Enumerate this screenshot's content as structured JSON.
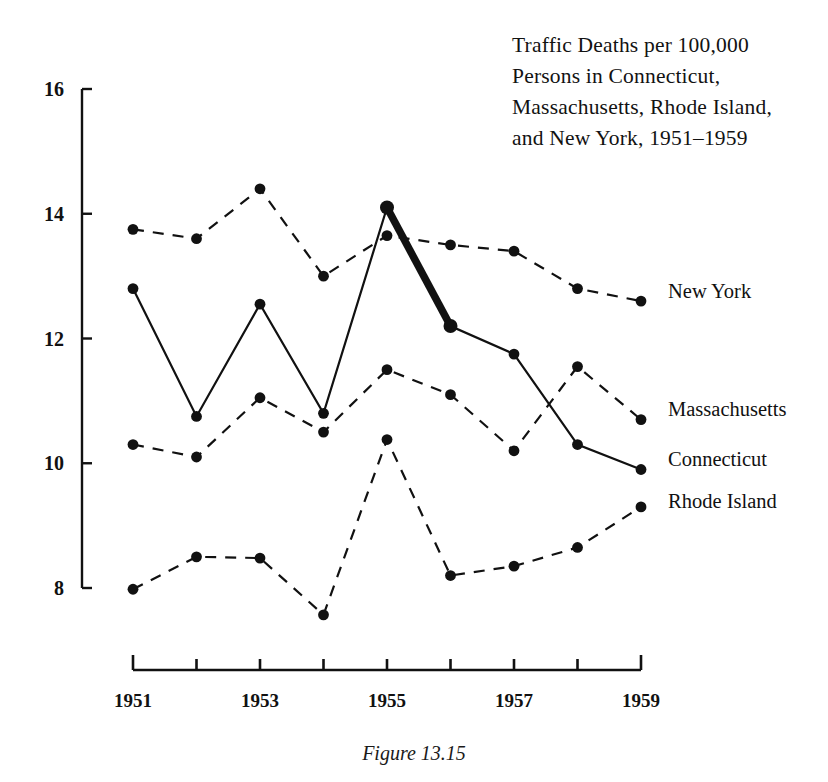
{
  "figure": {
    "caption": "Figure 13.15",
    "title_lines": [
      "Traffic Deaths per 100,000",
      "Persons in Connecticut,",
      "Massachusetts, Rhode Island,",
      "and New York, 1951–1959"
    ]
  },
  "axes": {
    "y_ticks": [
      "16",
      "14",
      "12",
      "10",
      "8"
    ],
    "x_ticks": [
      "1951",
      "",
      "1953",
      "",
      "1955",
      "",
      "1957",
      "",
      "1959"
    ],
    "x_tick_labels_visible": [
      "1951",
      "1953",
      "1955",
      "1957",
      "1959"
    ]
  },
  "series_labels": [
    {
      "name": "New York",
      "label": "New York"
    },
    {
      "name": "Massachusetts",
      "label": "Massachusetts"
    },
    {
      "name": "Connecticut",
      "label": "Connecticut"
    },
    {
      "name": "Rhode Island",
      "label": "Rhode Island"
    }
  ],
  "colors": {
    "ink": "#111111",
    "background": "#ffffff"
  },
  "chart_data": {
    "type": "line",
    "title": "Traffic Deaths per 100,000 Persons in Connecticut, Massachusetts, Rhode Island, and New York, 1951–1959",
    "xlabel": "",
    "ylabel": "",
    "x": [
      1951,
      1952,
      1953,
      1954,
      1955,
      1956,
      1957,
      1958,
      1959
    ],
    "categories": [
      "1951",
      "1952",
      "1953",
      "1954",
      "1955",
      "1956",
      "1957",
      "1958",
      "1959"
    ],
    "xlim": [
      1951,
      1959
    ],
    "ylim": [
      8,
      16
    ],
    "y_ticks": [
      8,
      10,
      12,
      14,
      16
    ],
    "grid": false,
    "legend": "right-edge-inline-labels",
    "series": [
      {
        "name": "New York",
        "style": "dashed",
        "marker": "filled-circle",
        "values": [
          13.75,
          13.6,
          14.4,
          13.0,
          13.65,
          13.5,
          13.4,
          12.8,
          12.6
        ]
      },
      {
        "name": "Connecticut",
        "style": "solid",
        "marker": "filled-circle",
        "highlight_segment": {
          "from": "1955",
          "to": "1956",
          "style": "thick-solid"
        },
        "values": [
          12.8,
          10.75,
          12.55,
          10.8,
          14.1,
          12.2,
          11.75,
          10.3,
          9.9
        ]
      },
      {
        "name": "Massachusetts",
        "style": "dashed",
        "marker": "filled-circle",
        "values": [
          10.3,
          10.1,
          11.05,
          10.5,
          11.5,
          11.1,
          10.2,
          11.55,
          10.7
        ]
      },
      {
        "name": "Rhode Island",
        "style": "dashed",
        "marker": "filled-circle",
        "values": [
          7.98,
          8.5,
          8.48,
          7.57,
          10.38,
          8.2,
          8.35,
          8.65,
          9.3
        ]
      }
    ]
  },
  "geometry": {
    "x_left_px": 133,
    "x_right_px": 641,
    "y_top_px": 89,
    "y_bottom_px": 588,
    "y_top_value": 16,
    "y_bottom_value": 8,
    "x_axis_line_y_px": 670,
    "label_y_px": {
      "New York": 287,
      "Massachusetts": 405,
      "Connecticut": 455,
      "Rhode Island": 497
    }
  }
}
